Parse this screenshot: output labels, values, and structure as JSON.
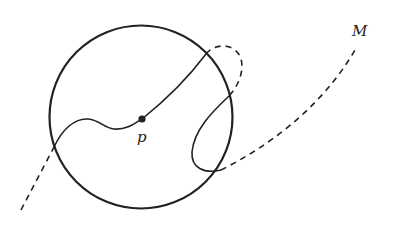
{
  "diagram": {
    "labels": {
      "point": "p",
      "manifold": "M"
    },
    "colors": {
      "stroke": "#222222",
      "background": "#ffffff"
    },
    "elements": [
      {
        "name": "ball-circle",
        "style": "solid"
      },
      {
        "name": "manifold-curve-inside",
        "style": "solid"
      },
      {
        "name": "manifold-curve-outside",
        "style": "dashed"
      },
      {
        "name": "point-p",
        "style": "filled-dot"
      }
    ]
  }
}
